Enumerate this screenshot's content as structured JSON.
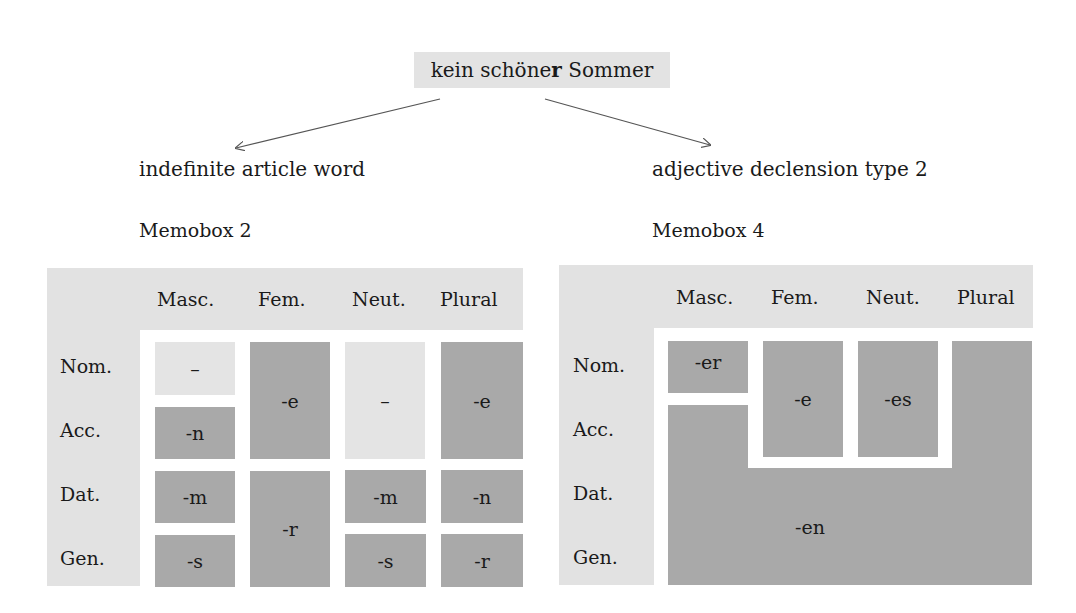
{
  "phrase": {
    "pre": "kein schöne",
    "bold": "r",
    "post": " Sommer"
  },
  "branches": {
    "left": {
      "label": "indefinite article word",
      "memobox": "Memobox 2"
    },
    "right": {
      "label": "adjective declension type 2",
      "memobox": "Memobox 4"
    }
  },
  "columns": [
    "Masc.",
    "Fem.",
    "Neut.",
    "Plural"
  ],
  "rows": [
    "Nom.",
    "Acc.",
    "Dat.",
    "Gen."
  ],
  "memobox2": {
    "masc_nom": "–",
    "masc_acc": "-n",
    "masc_dat": "-m",
    "masc_gen": "-s",
    "fem_nom_acc": "-e",
    "fem_dat_gen": "-r",
    "neut_nom_acc": "–",
    "neut_dat": "-m",
    "neut_gen": "-s",
    "pl_nom_acc": "-e",
    "pl_dat": "-n",
    "pl_gen": "-r"
  },
  "memobox4": {
    "masc_nom": "-er",
    "fem_nom_acc": "-e",
    "neut_nom_acc": "-es",
    "rest": "-en"
  },
  "colors": {
    "box": "#e2e2e2",
    "dark_cell": "#a9a9a9",
    "light_cell": "#e4e4e4"
  }
}
